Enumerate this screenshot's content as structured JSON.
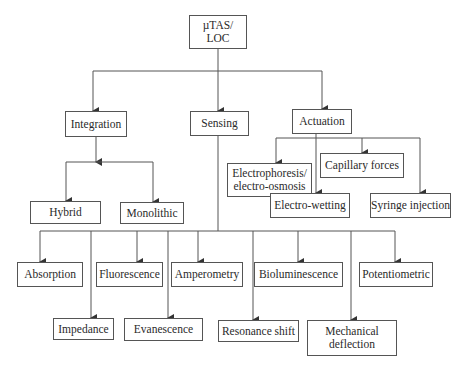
{
  "diagram": {
    "type": "hierarchy-tree",
    "colors": {
      "line": "#555555",
      "text": "#2a2a2a",
      "background": "#ffffff"
    },
    "root": {
      "label": "µTAS/\nLOC"
    },
    "level1": [
      {
        "id": "integration",
        "label": "Integration"
      },
      {
        "id": "sensing",
        "label": "Sensing"
      },
      {
        "id": "actuation",
        "label": "Actuation"
      }
    ],
    "integration_children": [
      {
        "label": "Hybrid"
      },
      {
        "label": "Monolithic"
      }
    ],
    "actuation_children": [
      {
        "label": "Electrophoresis/\nelectro-osmosis"
      },
      {
        "label": "Capillary forces"
      },
      {
        "label": "Electro-wetting"
      },
      {
        "label": "Syringe injection"
      }
    ],
    "sensing_children": [
      {
        "label": "Absorption"
      },
      {
        "label": "Impedance"
      },
      {
        "label": "Fluorescence"
      },
      {
        "label": "Evanescence"
      },
      {
        "label": "Amperometry"
      },
      {
        "label": "Resonance shift"
      },
      {
        "label": "Bioluminescence"
      },
      {
        "label": "Mechanical\ndeflection"
      },
      {
        "label": "Potentiometric"
      }
    ]
  }
}
